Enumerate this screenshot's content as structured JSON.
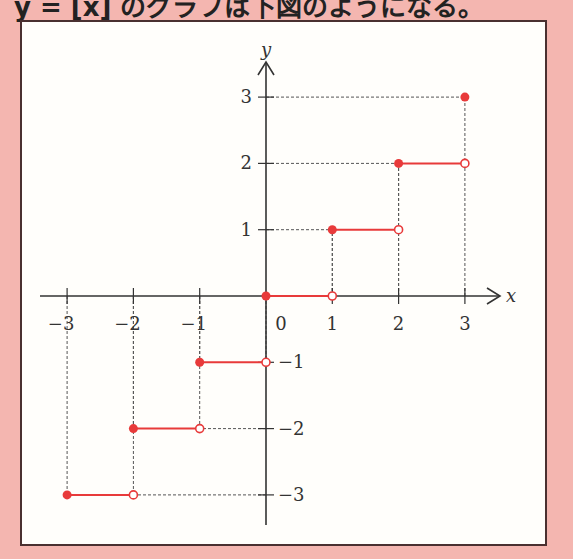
{
  "caption": "y = [x] のグラフは下図のようになる。",
  "colors": {
    "background": "#f4b6b0",
    "frame_fill": "#fffefb",
    "frame_border": "#4a3030",
    "axis": "#333333",
    "guide": "#555555",
    "step": "#e83a3a"
  },
  "chart_data": {
    "type": "line",
    "title": "",
    "function": "y = [x] (floor / greatest integer function)",
    "xlabel": "x",
    "ylabel": "y",
    "xlim": [
      -3.3,
      3.6
    ],
    "ylim": [
      -3.6,
      3.5
    ],
    "x_ticks": [
      -3,
      -2,
      -1,
      0,
      1,
      2,
      3
    ],
    "y_ticks": [
      -3,
      -2,
      -1,
      1,
      2,
      3
    ],
    "x_tick_labels": [
      "−3",
      "−2",
      "−1",
      "0",
      "1",
      "2",
      "3"
    ],
    "y_tick_labels": [
      "−3",
      "−2",
      "−1",
      "1",
      "2",
      "3"
    ],
    "origin_label": "0",
    "grid": false,
    "guides": "dashed lines from integer ticks to step endpoints",
    "segments": [
      {
        "x_start": -3,
        "x_end": -2,
        "y": -3,
        "start": "closed",
        "end": "open"
      },
      {
        "x_start": -2,
        "x_end": -1,
        "y": -2,
        "start": "closed",
        "end": "open"
      },
      {
        "x_start": -1,
        "x_end": 0,
        "y": -1,
        "start": "closed",
        "end": "open"
      },
      {
        "x_start": 0,
        "x_end": 1,
        "y": 0,
        "start": "closed",
        "end": "open"
      },
      {
        "x_start": 1,
        "x_end": 2,
        "y": 1,
        "start": "closed",
        "end": "open"
      },
      {
        "x_start": 2,
        "x_end": 3,
        "y": 2,
        "start": "closed",
        "end": "open"
      }
    ],
    "isolated_points": [
      {
        "x": 3,
        "y": 3,
        "type": "closed"
      }
    ]
  }
}
